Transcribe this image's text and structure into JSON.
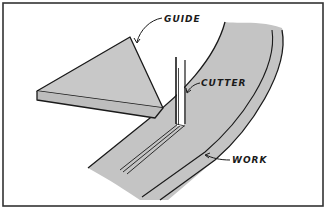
{
  "diagram": {
    "labels": {
      "guide": "GUIDE",
      "cutter": "CUTTER",
      "work": "WORK"
    },
    "colors": {
      "background": "#ffffff",
      "fill": "#c4c4c4",
      "stroke": "#1a1a1a",
      "frame": "#333333"
    }
  }
}
